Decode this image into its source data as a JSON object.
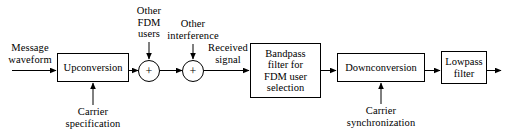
{
  "diagram": {
    "line_color": "#000000",
    "background": "#ffffff",
    "blocks": [
      {
        "id": "upconversion",
        "label": "Upconversion"
      },
      {
        "id": "bandpass",
        "label": "Bandpass\nfilter for\nFDM user\nselection"
      },
      {
        "id": "downconversion",
        "label": "Downconversion"
      },
      {
        "id": "lowpass",
        "label": "Lowpass\nfilter"
      }
    ],
    "adders": [
      {
        "id": "adder-1",
        "symbol": "+"
      },
      {
        "id": "adder-2",
        "symbol": "+"
      }
    ],
    "labels": {
      "message_waveform": "Message\nwaveform",
      "carrier_specification": "Carrier\nspecification",
      "other_fdm_users": "Other\nFDM\nusers",
      "other_interference": "Other\ninterference",
      "received_signal": "Received\nsignal",
      "carrier_synchronization": "Carrier\nsynchronization"
    }
  }
}
